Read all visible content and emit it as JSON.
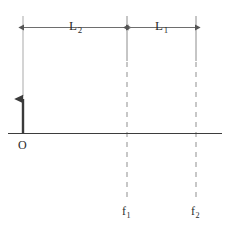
{
  "figure": {
    "origin_label": "O",
    "dimensions": [
      {
        "id": "L2",
        "label_main": "L",
        "label_sub": "2",
        "text": "L2",
        "from_x": 23,
        "to_x": 127
      },
      {
        "id": "L1",
        "label_main": "L",
        "label_sub": "1",
        "text": "L1",
        "from_x": 127,
        "to_x": 196
      }
    ],
    "markers": [
      {
        "id": "f1",
        "label_main": "f",
        "label_sub": "1",
        "text": "f1",
        "x": 127
      },
      {
        "id": "f2",
        "label_main": "f",
        "label_sub": "2",
        "text": "f2",
        "x": 196
      }
    ],
    "impulse": {
      "x": 23,
      "base_y": 133,
      "tip_y": 90
    },
    "axes": {
      "x_axis_y": 133,
      "x_axis_from": 8,
      "x_axis_to": 222,
      "y_axis_x": 23,
      "y_axis_top": 16,
      "y_axis_bottom": 133
    },
    "colors": {
      "ink": "#2b2b2b",
      "axis": "#4a4a4a",
      "guide": "#8c8c8c",
      "dash": "#9a9a9a",
      "background": "#ffffff"
    }
  }
}
